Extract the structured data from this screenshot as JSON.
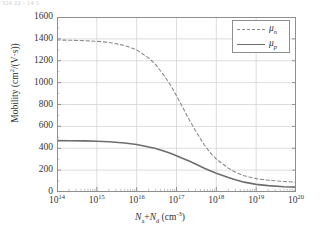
{
  "figure": {
    "top_strip_text": "324 22 - 14 5",
    "background_color": "#ffffff",
    "axis_color": "#8e8e8e",
    "grid_color": "#cfcfcf",
    "text_color": "#2f2f2f"
  },
  "chart_data": {
    "type": "line",
    "title": "",
    "subtitle": "",
    "xlabel": "Na+Nd (cm-3)",
    "xlabel_parts": {
      "n1": "N",
      "sub1": "a",
      "plus": "+",
      "n2": "N",
      "sub2": "d",
      "unit_open": " (cm",
      "unit_sup": "-3",
      "unit_close": ")"
    },
    "ylabel": "Mobility (cm2/(V·s))",
    "ylabel_parts": {
      "word": "Mobility (cm",
      "sup": "2",
      "rest": "/(V·s))"
    },
    "xscale": "log",
    "yscale": "linear",
    "xlim": [
      100000000000000.0,
      1e+20
    ],
    "ylim": [
      0,
      1600
    ],
    "grid": true,
    "grid_minor_ticks": true,
    "legend_position": "upper right",
    "x_ticks": [
      {
        "value": 100000000000000.0,
        "mantissa": "10",
        "exponent": "14"
      },
      {
        "value": 1000000000000000.0,
        "mantissa": "10",
        "exponent": "15"
      },
      {
        "value": 1e+16,
        "mantissa": "10",
        "exponent": "16"
      },
      {
        "value": 1e+17,
        "mantissa": "10",
        "exponent": "17"
      },
      {
        "value": 1e+18,
        "mantissa": "10",
        "exponent": "18"
      },
      {
        "value": 1e+19,
        "mantissa": "10",
        "exponent": "19"
      },
      {
        "value": 1e+20,
        "mantissa": "10",
        "exponent": "20"
      }
    ],
    "y_ticks": [
      0,
      200,
      400,
      600,
      800,
      1000,
      1200,
      1400,
      1600
    ],
    "series": [
      {
        "name": "μ_n",
        "legend_label_base": "μ",
        "legend_label_sub": "n",
        "style": "dashed",
        "color": "#8a8a8a",
        "width": 1.1,
        "x": [
          100000000000000.0,
          200000000000000.0,
          500000000000000.0,
          1000000000000000.0,
          2000000000000000.0,
          5000000000000000.0,
          1e+16,
          2e+16,
          3e+16,
          5e+16,
          7e+16,
          1e+17,
          1.5e+17,
          2e+17,
          3e+17,
          5e+17,
          7e+17,
          1e+18,
          2e+18,
          3e+18,
          5e+18,
          1e+19,
          2e+19,
          5e+19,
          1e+20
        ],
        "y": [
          1390,
          1388,
          1384,
          1378,
          1368,
          1340,
          1300,
          1225,
          1165,
          1060,
          980,
          880,
          760,
          672,
          560,
          430,
          360,
          300,
          218,
          182,
          148,
          122,
          108,
          96,
          90
        ]
      },
      {
        "name": "μ_p",
        "legend_label_base": "μ",
        "legend_label_sub": "p",
        "style": "solid",
        "color": "#6d6d6d",
        "width": 1.6,
        "x": [
          100000000000000.0,
          200000000000000.0,
          500000000000000.0,
          1000000000000000.0,
          2000000000000000.0,
          5000000000000000.0,
          1e+16,
          2e+16,
          3e+16,
          5e+16,
          7e+16,
          1e+17,
          1.5e+17,
          2e+17,
          3e+17,
          5e+17,
          7e+17,
          1e+18,
          2e+18,
          3e+18,
          5e+18,
          1e+19,
          2e+19,
          5e+19,
          1e+20
        ],
        "y": [
          470,
          469,
          467,
          464,
          459,
          448,
          434,
          412,
          397,
          373,
          355,
          332,
          305,
          285,
          256,
          218,
          195,
          172,
          132,
          112,
          90,
          70,
          58,
          48,
          45
        ]
      }
    ]
  },
  "legend": {
    "entries": [
      {
        "label_base": "μ",
        "label_sub": "n",
        "style": "dashed"
      },
      {
        "label_base": "μ",
        "label_sub": "p",
        "style": "solid"
      }
    ]
  }
}
